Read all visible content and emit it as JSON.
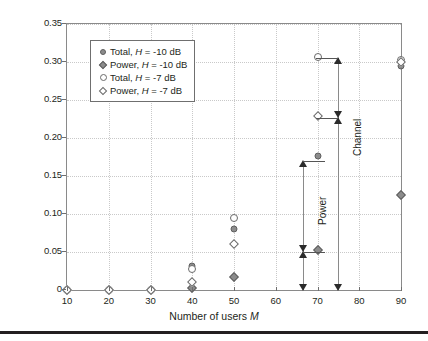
{
  "chart_data": {
    "type": "scatter",
    "title": "",
    "xlabel": "Number of users M",
    "ylabel": "Blocking probability",
    "xlim": [
      10,
      90
    ],
    "ylim": [
      0,
      0.35
    ],
    "xticks": [
      10,
      20,
      30,
      40,
      50,
      60,
      70,
      80,
      90
    ],
    "xtick_labels": [
      "10",
      "20",
      "30",
      "40",
      "50",
      "60",
      "70",
      "80",
      "90"
    ],
    "yticks": [
      0,
      0.05,
      0.1,
      0.15,
      0.2,
      0.25,
      0.3,
      0.35
    ],
    "ytick_labels": [
      "0",
      "0.05",
      "0.10",
      "0.15",
      "0.20",
      "0.25",
      "0.30",
      "0.35"
    ],
    "grid": true,
    "grid_style": "dotted",
    "legend_position": "upper-left",
    "series": [
      {
        "name": "Total, H = -10 dB",
        "marker": "filled-circle",
        "color": "#8c8c8c",
        "points": [
          {
            "x": 10,
            "y": 0.0
          },
          {
            "x": 20,
            "y": 0.0
          },
          {
            "x": 30,
            "y": 0.0
          },
          {
            "x": 40,
            "y": 0.031
          },
          {
            "x": 50,
            "y": 0.08
          },
          {
            "x": 70,
            "y": 0.176
          },
          {
            "x": 90,
            "y": 0.295
          }
        ]
      },
      {
        "name": "Power, H = -10 dB",
        "marker": "filled-diamond",
        "color": "#8c8c8c",
        "points": [
          {
            "x": 10,
            "y": 0.0
          },
          {
            "x": 20,
            "y": 0.0
          },
          {
            "x": 30,
            "y": 0.0
          },
          {
            "x": 40,
            "y": 0.002
          },
          {
            "x": 50,
            "y": 0.017
          },
          {
            "x": 70,
            "y": 0.053
          },
          {
            "x": 90,
            "y": 0.125
          }
        ]
      },
      {
        "name": "Total, H = -7 dB",
        "marker": "open-circle",
        "color": "#6a6a6a",
        "points": [
          {
            "x": 10,
            "y": 0.0
          },
          {
            "x": 20,
            "y": 0.0
          },
          {
            "x": 30,
            "y": 0.0
          },
          {
            "x": 40,
            "y": 0.028
          },
          {
            "x": 50,
            "y": 0.095
          },
          {
            "x": 70,
            "y": 0.307
          },
          {
            "x": 90,
            "y": 0.302
          }
        ]
      },
      {
        "name": "Power, H = -7 dB",
        "marker": "open-diamond",
        "color": "#6a6a6a",
        "points": [
          {
            "x": 10,
            "y": 0.0
          },
          {
            "x": 20,
            "y": 0.0
          },
          {
            "x": 30,
            "y": 0.0
          },
          {
            "x": 40,
            "y": 0.01
          },
          {
            "x": 50,
            "y": 0.061
          },
          {
            "x": 70,
            "y": 0.229
          },
          {
            "x": 90,
            "y": 0.3
          }
        ]
      }
    ],
    "annotations": [
      {
        "label": "Channel",
        "type": "double-arrow-vertical",
        "x": 75,
        "y_top": 0.305,
        "y_bottom": 0.0,
        "cap_top_y": 0.305,
        "cap_bottom_y": 0.226
      },
      {
        "label": "Power",
        "type": "double-arrow-vertical",
        "x": 66.5,
        "y_top": 0.17,
        "y_bottom": 0.0,
        "cap_top_y": 0.17,
        "cap_bottom_y": 0.05
      }
    ]
  },
  "legend": {
    "items": [
      {
        "marker": "filled-circle",
        "prefix": "Total, ",
        "italic": "H",
        "suffix": " = -10 dB"
      },
      {
        "marker": "filled-diamond",
        "prefix": "Power, ",
        "italic": "H",
        "suffix": " = -10 dB"
      },
      {
        "marker": "open-circle",
        "prefix": "Total, ",
        "italic": "H",
        "suffix": " = -7 dB"
      },
      {
        "marker": "open-diamond",
        "prefix": "Power, ",
        "italic": "H",
        "suffix": " = -7 dB"
      }
    ]
  },
  "axis_title": {
    "x_prefix": "Number of users ",
    "x_italic": "M",
    "y": "Blocking probability"
  }
}
